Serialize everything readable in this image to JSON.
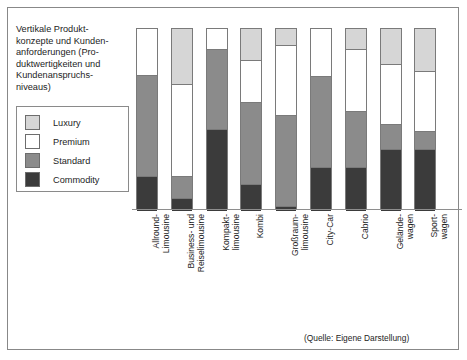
{
  "figure": {
    "title": "Vertikale Produkt-\nkonzepte und Kunden-\nanforderungen (Pro-\nduktwertigkeiten und\nKundenanspruchs-\nniveaus)",
    "source_note": "(Quelle: Eigene Darstellung)"
  },
  "colors": {
    "luxury": "#d6d6d6",
    "premium": "#ffffff",
    "standard": "#8b8b8b",
    "commodity": "#3b3b3b",
    "outline": "#7a7a7a",
    "frame": "#888888",
    "text": "#1d1d1d"
  },
  "legend": {
    "items": [
      {
        "label": "Luxury",
        "color": "#d6d6d6"
      },
      {
        "label": "Premium",
        "color": "#ffffff"
      },
      {
        "label": "Standard",
        "color": "#8b8b8b"
      },
      {
        "label": "Commodity",
        "color": "#3b3b3b"
      }
    ]
  },
  "chart_data": {
    "type": "bar",
    "stacked": true,
    "xlabel": "",
    "ylabel": "",
    "ylim": [
      0,
      100
    ],
    "grid": false,
    "legend_position": "left",
    "axis_ticks": [],
    "categories": [
      "Allround-\nLimousine",
      "Business- und\nReiselimousine",
      "Kompakt-\nlimousine",
      "Kombi",
      "Großraum-\nlimousine",
      "City-Car",
      "Cabrio",
      "Gelände-\nwagen",
      "Sport-\nwagen"
    ],
    "series": [
      {
        "name": "Luxury",
        "color": "#d6d6d6",
        "values": [
          0,
          30,
          0,
          17,
          9,
          0,
          11,
          19,
          23
        ]
      },
      {
        "name": "Premium",
        "color": "#ffffff",
        "values": [
          25,
          51,
          11,
          23,
          38,
          26,
          34,
          33,
          33
        ]
      },
      {
        "name": "Standard",
        "color": "#8b8b8b",
        "values": [
          56,
          12,
          44,
          45,
          50,
          50,
          31,
          14,
          10
        ]
      },
      {
        "name": "Commodity",
        "color": "#3b3b3b",
        "values": [
          19,
          7,
          45,
          15,
          3,
          24,
          24,
          34,
          34
        ]
      }
    ]
  }
}
